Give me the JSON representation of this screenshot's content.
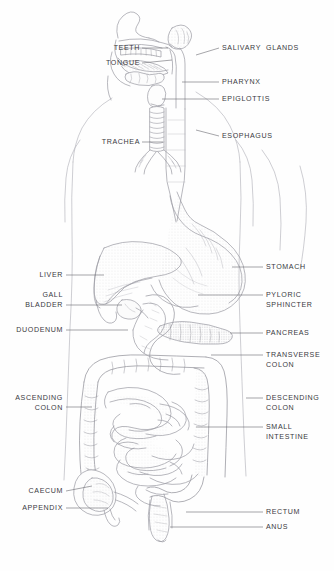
{
  "figure": {
    "style": "pen-and-ink anatomical line drawing",
    "background_color": "#fefefe",
    "ink_color": "#6f6f76",
    "label_color": "#3a3a3e"
  },
  "labels_left": [
    {
      "id": "teeth",
      "text": "TEETH",
      "x": 74,
      "y": 44,
      "w": 66,
      "leader": {
        "x1": 142,
        "y1": 48,
        "x2": 168,
        "y2": 48
      }
    },
    {
      "id": "tongue",
      "text": "TONGUE",
      "x": 64,
      "y": 59,
      "w": 76,
      "leader": {
        "x1": 142,
        "y1": 63,
        "x2": 172,
        "y2": 60
      }
    },
    {
      "id": "trachea",
      "text": "TRACHEA",
      "x": 60,
      "y": 138,
      "w": 80,
      "leader": {
        "x1": 142,
        "y1": 142,
        "x2": 163,
        "y2": 142
      }
    },
    {
      "id": "liver",
      "text": "LIVER",
      "x": 27,
      "y": 271,
      "w": 36,
      "leader": {
        "x1": 66,
        "y1": 275,
        "x2": 104,
        "y2": 275
      }
    },
    {
      "id": "gall-bladder",
      "text": "GALL\nBLADDER",
      "x": 8,
      "y": 291,
      "w": 55,
      "leader": {
        "x1": 66,
        "y1": 305,
        "x2": 122,
        "y2": 305
      }
    },
    {
      "id": "duodenum",
      "text": "DUODENUM",
      "x": 8,
      "y": 326,
      "w": 55,
      "leader": {
        "x1": 66,
        "y1": 330,
        "x2": 128,
        "y2": 330
      }
    },
    {
      "id": "ascending-colon",
      "text": "ASCENDING\nCOLON",
      "x": 8,
      "y": 394,
      "w": 55,
      "leader": {
        "x1": 66,
        "y1": 407,
        "x2": 92,
        "y2": 407
      }
    },
    {
      "id": "caecum",
      "text": "CAECUM",
      "x": 8,
      "y": 487,
      "w": 55,
      "leader": {
        "x1": 66,
        "y1": 491,
        "x2": 92,
        "y2": 486
      }
    },
    {
      "id": "appendix",
      "text": "APPENDIX",
      "x": 8,
      "y": 504,
      "w": 55,
      "leader": {
        "x1": 66,
        "y1": 508,
        "x2": 108,
        "y2": 508
      }
    }
  ],
  "labels_right": [
    {
      "id": "salivary-glands",
      "text": "SALIVARY  GLANDS",
      "x": 222,
      "y": 44,
      "leader": {
        "x1": 219,
        "y1": 48,
        "x2": 196,
        "y2": 55
      }
    },
    {
      "id": "pharynx",
      "text": "PHARYNX",
      "x": 222,
      "y": 78,
      "leader": {
        "x1": 219,
        "y1": 82,
        "x2": 182,
        "y2": 82
      }
    },
    {
      "id": "epiglottis",
      "text": "EPIGLOTTIS",
      "x": 222,
      "y": 95,
      "leader": {
        "x1": 219,
        "y1": 99,
        "x2": 162,
        "y2": 99
      }
    },
    {
      "id": "esophagus",
      "text": "ESOPHAGUS",
      "x": 222,
      "y": 132,
      "leader": {
        "x1": 219,
        "y1": 136,
        "x2": 196,
        "y2": 130
      }
    },
    {
      "id": "stomach",
      "text": "STOMACH",
      "x": 266,
      "y": 263,
      "leader": {
        "x1": 263,
        "y1": 267,
        "x2": 232,
        "y2": 267
      }
    },
    {
      "id": "pyloric-sphincter",
      "text": "PYLORIC\nSPHINCTER",
      "x": 266,
      "y": 291,
      "leader": {
        "x1": 263,
        "y1": 295,
        "x2": 198,
        "y2": 295
      }
    },
    {
      "id": "pancreas",
      "text": "PANCREAS",
      "x": 266,
      "y": 329,
      "leader": {
        "x1": 263,
        "y1": 333,
        "x2": 230,
        "y2": 333
      }
    },
    {
      "id": "transverse-colon",
      "text": "TRANSVERSE\nCOLON",
      "x": 266,
      "y": 351,
      "leader": {
        "x1": 263,
        "y1": 355,
        "x2": 211,
        "y2": 355
      }
    },
    {
      "id": "descending-colon",
      "text": "DESCENDING\nCOLON",
      "x": 266,
      "y": 394,
      "leader": {
        "x1": 263,
        "y1": 398,
        "x2": 246,
        "y2": 398
      }
    },
    {
      "id": "small-intestine",
      "text": "SMALL\nINTESTINE",
      "x": 266,
      "y": 423,
      "leader": {
        "x1": 263,
        "y1": 427,
        "x2": 196,
        "y2": 427
      }
    },
    {
      "id": "rectum",
      "text": "RECTUM",
      "x": 266,
      "y": 508,
      "leader": {
        "x1": 263,
        "y1": 512,
        "x2": 186,
        "y2": 512
      }
    },
    {
      "id": "anus",
      "text": "ANUS",
      "x": 266,
      "y": 523,
      "leader": {
        "x1": 263,
        "y1": 527,
        "x2": 170,
        "y2": 527
      }
    }
  ]
}
